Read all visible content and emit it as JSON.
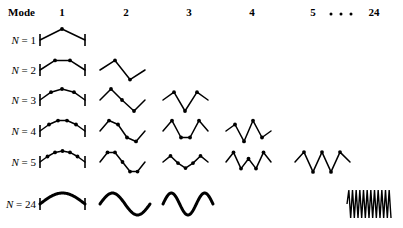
{
  "figure": {
    "title_label": "Mode",
    "background_color": "#ffffff",
    "ink_color": "#000000",
    "width": 403,
    "height": 228
  },
  "header": {
    "row_header": "Mode",
    "columns": [
      {
        "label": "1",
        "x": 62
      },
      {
        "label": "2",
        "x": 126
      },
      {
        "label": "3",
        "x": 189
      },
      {
        "label": "4",
        "x": 252
      },
      {
        "label": "5",
        "x": 313
      },
      {
        "label": "24",
        "x": 374
      }
    ],
    "ellipsis": {
      "label": "dots",
      "x": 341,
      "count": 3
    },
    "y": 14,
    "row_header_x": 8
  },
  "rows": [
    {
      "label": "N = 1",
      "n": 1,
      "label_x": 36,
      "y": 40,
      "style": "polyline"
    },
    {
      "label": "N = 2",
      "n": 2,
      "label_x": 36,
      "y": 70,
      "style": "polyline"
    },
    {
      "label": "N = 3",
      "n": 3,
      "label_x": 36,
      "y": 100,
      "style": "polyline"
    },
    {
      "label": "N = 4",
      "n": 4,
      "label_x": 36,
      "y": 131,
      "style": "polyline"
    },
    {
      "label": "N = 5",
      "n": 5,
      "label_x": 36,
      "y": 162,
      "style": "polyline"
    },
    {
      "label": "N = 24",
      "n": 24,
      "label_x": 36,
      "y": 204,
      "style": "smooth"
    }
  ],
  "chart_data": {
    "type": "line",
    "xlabel": "Mode",
    "ylabel": "N",
    "column_span": 52,
    "amplitude": 11,
    "cells": [
      {
        "row": 1,
        "mode": 1,
        "x0": 40,
        "x1": 85,
        "walls": true,
        "dots": true,
        "amplitudes": [
          1
        ],
        "points": [
          [
            40,
            0
          ],
          [
            62,
            -1
          ],
          [
            85,
            0
          ]
        ]
      },
      {
        "row": 2,
        "mode": 1,
        "x0": 40,
        "x1": 85,
        "walls": true,
        "dots": true,
        "amplitudes": [
          0.87,
          0.87
        ],
        "points": [
          [
            40,
            0
          ],
          [
            55,
            -0.87
          ],
          [
            70,
            -0.87
          ],
          [
            85,
            0
          ]
        ]
      },
      {
        "row": 2,
        "mode": 2,
        "x0": 100,
        "x1": 145,
        "walls": false,
        "dots": true,
        "amplitudes": [
          0.87,
          -0.87
        ],
        "points": [
          [
            100,
            0
          ],
          [
            115,
            -0.87
          ],
          [
            130,
            0.87
          ],
          [
            145,
            0
          ]
        ]
      },
      {
        "row": 3,
        "mode": 1,
        "x0": 40,
        "x1": 85,
        "walls": true,
        "dots": true,
        "amplitudes": [
          0.71,
          1.0,
          0.71
        ],
        "points": [
          [
            40,
            0
          ],
          [
            51,
            -0.71
          ],
          [
            62,
            -1.0
          ],
          [
            74,
            -0.71
          ],
          [
            85,
            0
          ]
        ]
      },
      {
        "row": 3,
        "mode": 2,
        "x0": 100,
        "x1": 145,
        "walls": false,
        "dots": true,
        "amplitudes": [
          1.0,
          0.0,
          -1.0
        ],
        "points": [
          [
            100,
            0
          ],
          [
            111,
            -1.0
          ],
          [
            122,
            0.0
          ],
          [
            134,
            1.0
          ],
          [
            145,
            0
          ]
        ]
      },
      {
        "row": 3,
        "mode": 3,
        "x0": 163,
        "x1": 208,
        "walls": false,
        "dots": true,
        "amplitudes": [
          0.71,
          -1.0,
          0.71
        ],
        "points": [
          [
            163,
            0
          ],
          [
            174,
            -0.71
          ],
          [
            185,
            1.0
          ],
          [
            197,
            -0.71
          ],
          [
            208,
            0
          ]
        ]
      },
      {
        "row": 4,
        "mode": 1,
        "x0": 40,
        "x1": 85,
        "walls": true,
        "dots": true,
        "amplitudes": [
          0.59,
          0.95,
          0.95,
          0.59
        ],
        "points": [
          [
            40,
            0
          ],
          [
            49,
            -0.59
          ],
          [
            58,
            -0.95
          ],
          [
            67,
            -0.95
          ],
          [
            76,
            -0.59
          ],
          [
            85,
            0
          ]
        ]
      },
      {
        "row": 4,
        "mode": 2,
        "x0": 100,
        "x1": 145,
        "walls": false,
        "dots": true,
        "amplitudes": [
          0.95,
          0.59,
          -0.59,
          -0.95
        ],
        "points": [
          [
            100,
            0
          ],
          [
            109,
            -0.95
          ],
          [
            118,
            -0.59
          ],
          [
            127,
            0.59
          ],
          [
            136,
            0.95
          ],
          [
            145,
            0
          ]
        ]
      },
      {
        "row": 4,
        "mode": 3,
        "x0": 163,
        "x1": 208,
        "walls": false,
        "dots": true,
        "amplitudes": [
          0.95,
          -0.59,
          -0.59,
          0.95
        ],
        "points": [
          [
            163,
            0
          ],
          [
            172,
            -0.95
          ],
          [
            181,
            0.59
          ],
          [
            190,
            0.59
          ],
          [
            199,
            -0.95
          ],
          [
            208,
            0
          ]
        ]
      },
      {
        "row": 4,
        "mode": 4,
        "x0": 226,
        "x1": 271,
        "walls": false,
        "dots": true,
        "amplitudes": [
          0.59,
          -0.95,
          0.95,
          -0.59
        ],
        "points": [
          [
            226,
            0
          ],
          [
            235,
            -0.59
          ],
          [
            244,
            0.95
          ],
          [
            253,
            -0.95
          ],
          [
            262,
            0.59
          ],
          [
            271,
            0
          ]
        ]
      },
      {
        "row": 5,
        "mode": 1,
        "x0": 40,
        "x1": 85,
        "walls": true,
        "dots": true,
        "amplitudes": [
          0.5,
          0.87,
          1.0,
          0.87,
          0.5
        ],
        "points": [
          [
            40,
            0
          ],
          [
            47.5,
            -0.5
          ],
          [
            55,
            -0.87
          ],
          [
            62.5,
            -1.0
          ],
          [
            70,
            -0.87
          ],
          [
            77.5,
            -0.5
          ],
          [
            85,
            0
          ]
        ]
      },
      {
        "row": 5,
        "mode": 2,
        "x0": 100,
        "x1": 145,
        "walls": false,
        "dots": true,
        "amplitudes": [
          0.87,
          0.87,
          0.0,
          -0.87,
          -0.87
        ],
        "points": [
          [
            100,
            0
          ],
          [
            107.5,
            -0.87
          ],
          [
            115,
            -0.87
          ],
          [
            122.5,
            0.0
          ],
          [
            130,
            0.87
          ],
          [
            137.5,
            0.87
          ],
          [
            145,
            0
          ]
        ]
      },
      {
        "row": 5,
        "mode": 3,
        "x0": 163,
        "x1": 208,
        "walls": false,
        "dots": true,
        "amplitudes": [
          1.0,
          0.0,
          -1.0,
          0.0,
          1.0
        ],
        "points": [
          [
            163,
            0
          ],
          [
            170.5,
            -0.55
          ],
          [
            178,
            0.1
          ],
          [
            185.5,
            0.55
          ],
          [
            193,
            0.1
          ],
          [
            200.5,
            -0.55
          ],
          [
            208,
            0
          ]
        ]
      },
      {
        "row": 5,
        "mode": 4,
        "x0": 226,
        "x1": 271,
        "walls": false,
        "dots": true,
        "amplitudes": [
          0.87,
          -0.87,
          0.0,
          0.87,
          -0.87
        ],
        "points": [
          [
            226,
            0
          ],
          [
            233.5,
            -0.87
          ],
          [
            241,
            0.6
          ],
          [
            248.5,
            -0.3
          ],
          [
            256,
            0.6
          ],
          [
            263.5,
            -0.87
          ],
          [
            271,
            0
          ]
        ]
      },
      {
        "row": 5,
        "mode": 5,
        "x0": 295,
        "x1": 350,
        "walls": false,
        "dots": true,
        "amplitudes": [
          0.5,
          -0.87,
          1.0,
          -0.87,
          0.5
        ],
        "points": [
          [
            295,
            0
          ],
          [
            304,
            -0.9
          ],
          [
            313,
            0.9
          ],
          [
            322,
            -0.9
          ],
          [
            331,
            0.9
          ],
          [
            340,
            -0.9
          ],
          [
            350,
            0
          ]
        ]
      },
      {
        "row": 24,
        "mode": 1,
        "x0": 40,
        "x1": 85,
        "walls": true,
        "dots": false,
        "curve": "half-sine",
        "periods": 0.5
      },
      {
        "row": 24,
        "mode": 2,
        "x0": 100,
        "x1": 150,
        "walls": false,
        "dots": false,
        "curve": "sine",
        "periods": 1.0
      },
      {
        "row": 24,
        "mode": 3,
        "x0": 163,
        "x1": 213,
        "walls": false,
        "dots": false,
        "curve": "sine",
        "periods": 1.5
      },
      {
        "row": 24,
        "mode": 24,
        "x0": 347,
        "x1": 391,
        "walls": false,
        "dots": false,
        "curve": "dense-zigzag",
        "periods": 12
      }
    ]
  }
}
